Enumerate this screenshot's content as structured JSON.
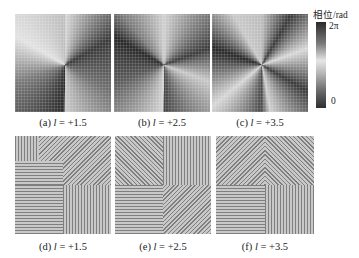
{
  "figure": {
    "colorbar": {
      "title": "相位/rad",
      "max_label": "2π",
      "min_label": "0"
    },
    "top_row": [
      {
        "id": "a",
        "prefix": "(a) ",
        "var": "l",
        "value": " = +1.5"
      },
      {
        "id": "b",
        "prefix": "(b) ",
        "var": "l",
        "value": " = +2.5"
      },
      {
        "id": "c",
        "prefix": "(c) ",
        "var": "l",
        "value": " = +3.5"
      }
    ],
    "bottom_row": [
      {
        "id": "d",
        "prefix": "(d) ",
        "var": "l",
        "value": " = +1.5"
      },
      {
        "id": "e",
        "prefix": "(e) ",
        "var": "l",
        "value": " = +2.5"
      },
      {
        "id": "f",
        "prefix": "(f) ",
        "var": "l",
        "value": " = +3.5"
      }
    ]
  }
}
